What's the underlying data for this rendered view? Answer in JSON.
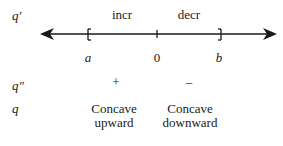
{
  "rows": {
    "q_prime": {
      "label": "q′"
    },
    "q_double_prime": {
      "label": "q″"
    },
    "q": {
      "label": "q"
    }
  },
  "intervals": {
    "left": {
      "derivative": "incr",
      "second_derivative_sign": "+",
      "concavity_line1": "Concave",
      "concavity_line2": "upward"
    },
    "right": {
      "derivative": "decr",
      "second_derivative_sign": "–",
      "concavity_line1": "Concave",
      "concavity_line2": "downward"
    }
  },
  "number_line": {
    "points": [
      {
        "label": "a",
        "marker": "["
      },
      {
        "label": "0",
        "marker": "tick"
      },
      {
        "label": "b",
        "marker": "]"
      }
    ],
    "color": "#1a1a1a"
  }
}
